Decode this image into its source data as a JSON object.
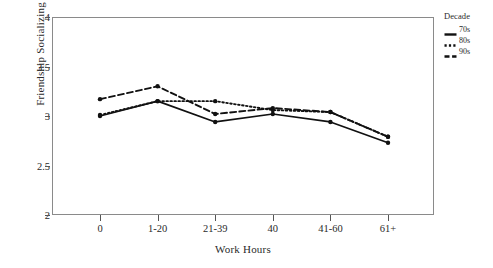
{
  "chart_data": {
    "type": "line",
    "title": "",
    "xlabel": "Work Hours",
    "ylabel": "Friendship Socializing",
    "categories": [
      "0",
      "1-20",
      "21-39",
      "40",
      "41-60",
      "61+"
    ],
    "ylim": [
      2,
      4
    ],
    "yticks": [
      2,
      2.5,
      3,
      3.5,
      4
    ],
    "ytick_labels": [
      "2",
      "2.5",
      "3",
      "3.5",
      "4"
    ],
    "grid": false,
    "legend_position": "right",
    "legend_title": "Decade",
    "series": [
      {
        "name": "70s",
        "style": "solid",
        "marker": "circle",
        "color": "#111111",
        "values": [
          3.0,
          3.15,
          2.94,
          3.02,
          2.94,
          2.73
        ]
      },
      {
        "name": "80s",
        "style": "dotted",
        "marker": "circle",
        "color": "#111111",
        "values": [
          3.01,
          3.15,
          3.15,
          3.06,
          3.04,
          2.79
        ]
      },
      {
        "name": "90s",
        "style": "dashed",
        "marker": "circle",
        "color": "#111111",
        "values": [
          3.17,
          3.3,
          3.02,
          3.08,
          3.04,
          2.79
        ]
      }
    ]
  },
  "legend": {
    "title": "Decade",
    "entries": [
      {
        "label": "70s",
        "style": "solid"
      },
      {
        "label": "80s",
        "style": "dotted"
      },
      {
        "label": "90s",
        "style": "dashed"
      }
    ]
  },
  "axes": {
    "x_title": "Work Hours",
    "y_title": "Friendship Socializing",
    "x_tick_labels": [
      "0",
      "1-20",
      "21-39",
      "40",
      "41-60",
      "61+"
    ],
    "y_tick_labels": [
      "4",
      "3.5",
      "3",
      "2.5",
      "2"
    ]
  }
}
